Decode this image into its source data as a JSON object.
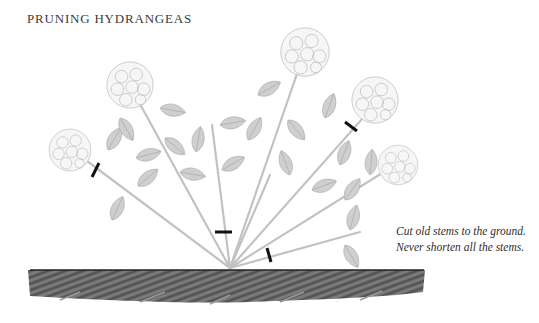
{
  "title": "PRUNING HYDRANGEAS",
  "caption": "Cut old stems to the ground. Never shorten all the stems.",
  "illustration": {
    "subject": "hydrangea shrub with stems radiating from ground",
    "flower_heads": 5,
    "cut_marks": 5,
    "colors": {
      "plant": "#bdbdbd",
      "cut_mark": "#111111",
      "soil": "#4a4a4a"
    }
  }
}
